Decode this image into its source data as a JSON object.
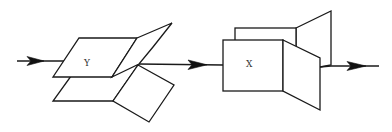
{
  "diagram": {
    "colors": {
      "stroke": "#1a1a1a",
      "fill": "#ffffff",
      "arrowhead": "#111111",
      "label": "#333333"
    },
    "blocks": [
      {
        "id": "block-y",
        "label": "Y"
      },
      {
        "id": "block-x",
        "label": "X"
      }
    ],
    "arrows": [
      {
        "id": "input-arrow",
        "from": "input",
        "to": "Y"
      },
      {
        "id": "middle-arrow",
        "from": "Y",
        "to": "X"
      },
      {
        "id": "output-arrow",
        "from": "X",
        "to": "output"
      }
    ]
  }
}
